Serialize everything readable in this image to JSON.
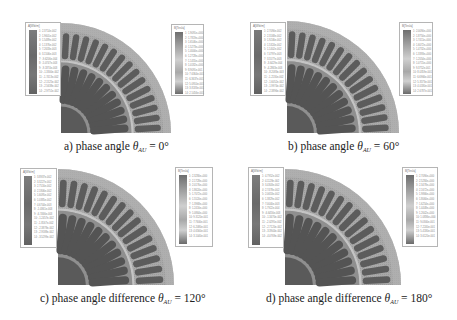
{
  "figure": {
    "panels": [
      {
        "id": "a",
        "caption_prefix": "a) phase angle ",
        "symbol": "θ",
        "subscript": "AU",
        "caption_suffix": " = 0°",
        "legend_left_title": "A[Wb/m]",
        "legend_right_title": "B[Tesla]",
        "legend_left_values": [
          "2.3714e-002",
          "1.9601e-002",
          "1.5489e-002",
          "1.1376e-002",
          "7.2633e-003",
          "3.1506e-003",
          "-9.6206e-004",
          "-5.0747e-003",
          "-9.1874e-003",
          "-1.3300e-002",
          "-1.7413e-002",
          "-2.1525e-002",
          "-2.5638e-002",
          "-2.9751e-002"
        ],
        "legend_right_values": [
          "1.9091e+000",
          "1.7819e+000",
          "1.6546e+000",
          "1.5273e+000",
          "1.4000e+000",
          "1.2728e+000",
          "1.1455e+000",
          "1.0182e+000",
          "8.9091e-001",
          "7.6364e-001",
          "6.3637e-001",
          "5.0910e-001",
          "3.8183e-001",
          "2.5456e-001"
        ]
      },
      {
        "id": "b",
        "caption_prefix": "b) phase angle ",
        "symbol": "θ",
        "subscript": "AU",
        "caption_suffix": " = 60°",
        "legend_left_title": "A[Wb/m]",
        "legend_right_title": "B[Tesla]",
        "legend_left_values": [
          "2.7090e-002",
          "2.3168e-002",
          "1.9246e-002",
          "1.5324e-002",
          "1.1402e-002",
          "7.4797e-003",
          "3.5577e-003",
          "-3.6429e-004",
          "-4.2863e-003",
          "-8.2083e-003",
          "-1.2130e-002",
          "-1.6052e-002",
          "-1.9974e-002",
          "-2.3896e-002"
        ],
        "legend_right_values": [
          "2.0090e+000",
          "1.8750e+000",
          "1.7411e+000",
          "1.6072e+000",
          "1.4732e+000",
          "1.3393e+000",
          "1.2054e+000",
          "1.0715e+000",
          "9.3752e-001",
          "8.0359e-001",
          "6.6966e-001",
          "5.3573e-001",
          "4.0180e-001",
          "2.6787e-001"
        ]
      },
      {
        "id": "c",
        "caption_prefix": "c) phase angle difference ",
        "symbol": "θ",
        "subscript": "AU",
        "caption_suffix": " = 120°",
        "legend_left_title": "A[Wb/m]",
        "legend_right_title": "B[Tesla]",
        "legend_left_values": [
          "3.8937e-002",
          "3.3227e-002",
          "2.7516e-002",
          "2.1806e-002",
          "1.6095e-002",
          "1.0385e-002",
          "4.6744e-003",
          "-1.0361e-003",
          "-6.7466e-003",
          "-1.2457e-002",
          "-1.8167e-002",
          "-2.3878e-002",
          "-2.9588e-002",
          "-3.5299e-002"
        ],
        "legend_right_values": [
          "2.3280e+000",
          "2.1728e+000",
          "2.0176e+000",
          "1.8624e+000",
          "1.7072e+000",
          "1.5520e+000",
          "1.3968e+000",
          "1.2416e+000",
          "1.0864e+000",
          "9.3120e-001",
          "7.7600e-001",
          "6.2080e-001",
          "4.6560e-001",
          "3.1040e-001"
        ]
      },
      {
        "id": "d",
        "caption_prefix": "d) phase angle difference ",
        "symbol": "θ",
        "subscript": "AU",
        "caption_suffix": " = 180°",
        "legend_left_title": "A[Wb/m]",
        "legend_right_title": "B[Tesla]",
        "legend_left_values": [
          "4.7952e-002",
          "4.1128e-002",
          "3.4303e-002",
          "2.7478e-002",
          "2.0653e-002",
          "1.3829e-002",
          "7.0040e-003",
          "1.7922e-004",
          "-6.6456e-003",
          "-1.3470e-002",
          "-2.0295e-002",
          "-2.7120e-002",
          "-3.3944e-002",
          "-4.0769e-002"
        ],
        "legend_right_values": [
          "2.7090e+000",
          "2.5284e+000",
          "2.3478e+000",
          "2.1672e+000",
          "1.9866e+000",
          "1.8060e+000",
          "1.6254e+000",
          "1.4448e+000",
          "1.2642e+000",
          "1.0836e+000",
          "9.0300e-001",
          "7.2240e-001",
          "5.4180e-001",
          "3.6120e-001"
        ]
      }
    ]
  },
  "colors": {
    "stator_fill": "#a9a9a9",
    "rotor_fill": "#8f8f8f",
    "slot_fill": "#5c5c5c",
    "magnet_fill": "#545454",
    "shaft_fill": "#5a5a5a",
    "airgap_fill": "#c4c4c4"
  }
}
